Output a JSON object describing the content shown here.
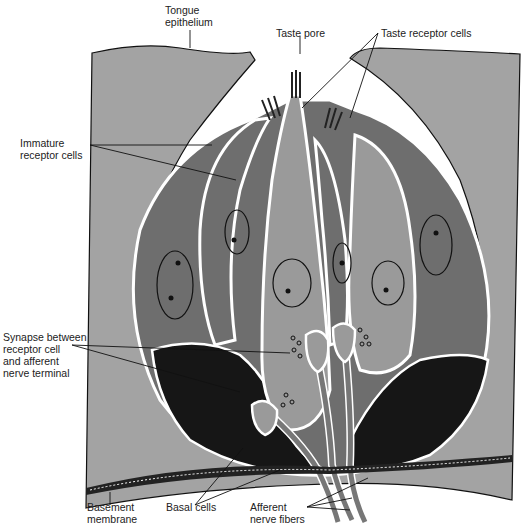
{
  "figure": {
    "colors": {
      "epithelium": "#a3a3a3",
      "immature_cell": "#6e6e6e",
      "receptor_cell": "#9a9a9a",
      "basal_cell": "#161616",
      "membrane_white": "#ffffff",
      "outline": "#111111"
    }
  },
  "labels": {
    "tongue_epithelium": "Tongue\nepithelium",
    "taste_pore": "Taste pore",
    "taste_receptor_cells": "Taste receptor cells",
    "immature_receptor_cells": "Immature\nreceptor cells",
    "synapse": "Synapse between\nreceptor cell\nand afferent\nnerve terminal",
    "basement_membrane": "Basement\nmembrane",
    "basal_cells": "Basal cells",
    "afferent_nerve_fibers": "Afferent\nnerve fibers"
  }
}
